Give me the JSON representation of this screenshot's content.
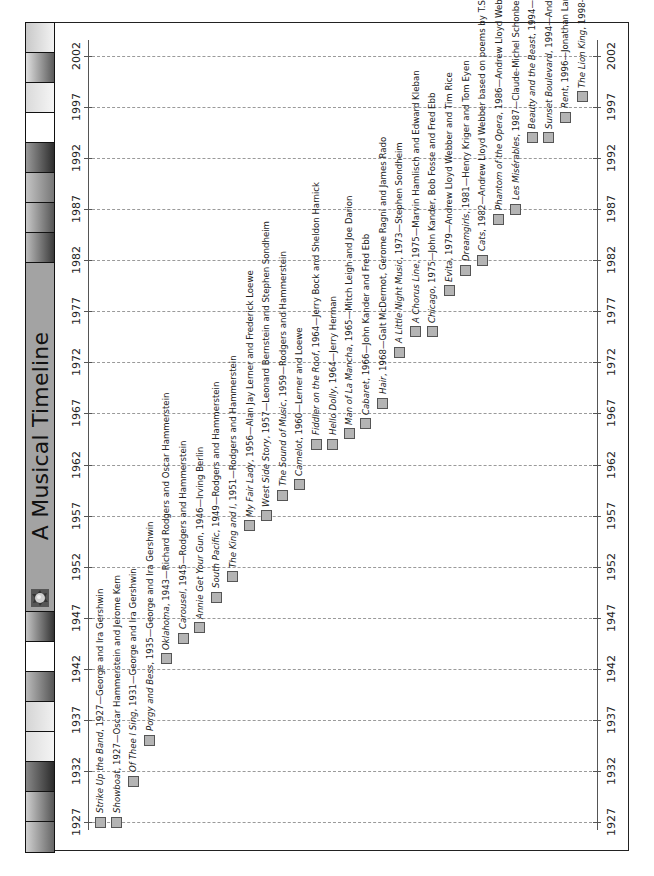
{
  "title": "A Musical Timeline",
  "colors": {
    "marker": "#b4b4b4",
    "title_strip": "#a3a3a3",
    "grid": "#9a9a9a"
  },
  "chart_data": {
    "type": "timeline",
    "title": "A Musical Timeline",
    "orientation": "rotated -90 degrees (years increase upward)",
    "axis": {
      "min": 1927,
      "max": 2002,
      "ticks": [
        1927,
        1932,
        1937,
        1942,
        1947,
        1952,
        1957,
        1962,
        1967,
        1972,
        1977,
        1982,
        1987,
        1992,
        1997,
        2002
      ],
      "grid": true
    },
    "events": [
      {
        "title": "Strike Up the Band",
        "year": 1927,
        "credits": "George and Ira Gershwin",
        "italic": true
      },
      {
        "title": "Showboat",
        "year": 1927,
        "credits": "Oscar Hammerstein and Jerome Kern",
        "italic": true
      },
      {
        "title": "Of Thee I Sing",
        "year": 1931,
        "credits": "George and Ira Gershwin",
        "italic": true
      },
      {
        "title": "Porgy and Bess",
        "year": 1935,
        "credits": "George and Ira Gershwin",
        "italic": true
      },
      {
        "title": "Oklahoma",
        "year": 1943,
        "credits": "Richard Rodgers and Oscar Hammerstein",
        "italic": true
      },
      {
        "title": "Carousel",
        "year": 1945,
        "credits": "Rodgers and Hammerstein",
        "italic": true
      },
      {
        "title": "Annie Get Your Gun",
        "year": 1946,
        "credits": "Irving Berlin",
        "italic": true
      },
      {
        "title": "South Pacific",
        "year": 1949,
        "credits": "Rodgers and Hammerstein",
        "italic": true
      },
      {
        "title": "The King and I",
        "year": 1951,
        "credits": "Rodgers and Hammerstein",
        "italic": true
      },
      {
        "title": "My Fair Lady",
        "year": 1956,
        "credits": "Alan Jay Lerner and Frederick Loewe",
        "italic": true
      },
      {
        "title": "West Side Story",
        "year": 1957,
        "credits": "Leonard Bernstein and Stephen Sondheim",
        "italic": true
      },
      {
        "title": "The Sound of Music",
        "year": 1959,
        "credits": "Rodgers and Hammerstein",
        "italic": true
      },
      {
        "title": "Camelot",
        "year": 1960,
        "credits": "Lerner and Loewe",
        "italic": true
      },
      {
        "title": "Fiddler on the Roof",
        "year": 1964,
        "credits": "Jerry Bock and Sheldon Harnick",
        "italic": true
      },
      {
        "title": "Hello Dolly",
        "year": 1964,
        "credits": "Jerry Herman",
        "italic": true
      },
      {
        "title": "Man of La Mancha",
        "year": 1965,
        "credits": "Mitch Leigh and Joe Darion",
        "italic": true
      },
      {
        "title": "Cabaret",
        "year": 1966,
        "credits": "John Kander and Fred Ebb",
        "italic": true
      },
      {
        "title": "Hair",
        "year": 1968,
        "credits": "Galt McDermot, Gerome Ragni and James Rado",
        "italic": true
      },
      {
        "title": "A Little Night Music",
        "year": 1973,
        "credits": "Stephen Sondheim",
        "italic": true
      },
      {
        "title": "A Chorus Line",
        "year": 1975,
        "credits": "Marvin Hamlisch and Edward Kleban",
        "italic": true
      },
      {
        "title": "Chicago",
        "year": 1975,
        "credits": "John Kander, Bob Fosse and Fred Ebb",
        "italic": true
      },
      {
        "title": "Evita",
        "year": 1979,
        "credits": "Andrew Lloyd Webber and Tim Rice",
        "italic": true
      },
      {
        "title": "Dreamgirls",
        "year": 1981,
        "credits": "Henry Kriger and Tom Eyen",
        "italic": true
      },
      {
        "title": "Cats",
        "year": 1982,
        "credits": "Andrew Lloyd Webber based on poems by T.S. Eliot",
        "italic": true
      },
      {
        "title": "Phantom of the Opera",
        "year": 1986,
        "credits": "Andrew Lloyd Webber and Charles Hart",
        "italic": true
      },
      {
        "title": "Les Misérables",
        "year": 1987,
        "credits": "Claude-Michel Schonberg and Herbert Kretzmer",
        "italic": true
      },
      {
        "title": "Beauty and the Beast",
        "year": 1994,
        "credits": "Alan Menken, Howard Ashman and Tim Rice",
        "italic": true
      },
      {
        "title": "Sunset Boulevard",
        "year": 1994,
        "credits": "Andrew Lloyd Webber, Don Black and Chris Hampton",
        "italic": true
      },
      {
        "title": "Rent",
        "year": 1996,
        "credits": "Jonathan Larson",
        "italic": true
      },
      {
        "title": "The Lion King",
        "year": 1998,
        "credits": "Elton John and Tim Rice",
        "italic": true
      }
    ]
  }
}
